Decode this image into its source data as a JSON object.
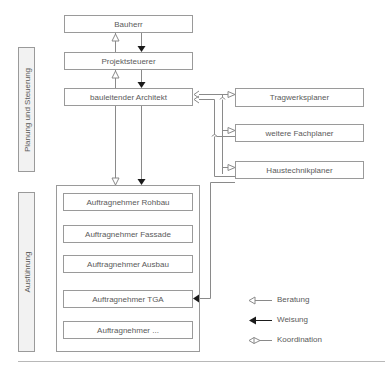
{
  "diagram": {
    "side_labels": {
      "planning": "Planung und Steuerung",
      "execution": "Ausführung"
    },
    "main_chain": {
      "client": "Bauherr",
      "project_controller": "Projektsteuerer",
      "site_architect": "bauleitender Architekt"
    },
    "planners": [
      {
        "label": "Tragwerksplaner"
      },
      {
        "label": "weitere Fachplaner"
      },
      {
        "label": "Haustechnikplaner"
      }
    ],
    "contractors": [
      {
        "label": "Auftragnehmer Rohbau"
      },
      {
        "label": "Auftragnehmer Fassade"
      },
      {
        "label": "Auftragnehmer Ausbau"
      },
      {
        "label": "Auftragnehmer TGA"
      },
      {
        "label": "Auftragnehmer ..."
      }
    ],
    "legend": [
      {
        "label": "Beratung",
        "icon": "open-arrow-icon"
      },
      {
        "label": "Weisung",
        "icon": "solid-arrow-icon"
      },
      {
        "label": "Koordination",
        "icon": "coordination-arrow-icon"
      }
    ],
    "colors": {
      "line": "#8a8a8a",
      "box_border": "#9a9a9a",
      "side_fill": "#f2f2f2",
      "text": "#5a5a5a",
      "arrow_solid": "#1a1a1a"
    }
  }
}
